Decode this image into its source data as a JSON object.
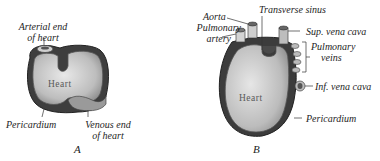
{
  "figure": {
    "panels": [
      {
        "id": "A",
        "letter": "A",
        "organ_label": "Heart",
        "labels": {
          "arterial_end_line1": "Arterial end",
          "arterial_end_line2": "of heart",
          "pericardium": "Pericardium",
          "venous_end_line1": "Venous end",
          "venous_end_line2": "of heart"
        }
      },
      {
        "id": "B",
        "letter": "B",
        "organ_label": "Heart",
        "labels": {
          "aorta": "Aorta",
          "pulmonary_artery_line1": "Pulmonary",
          "pulmonary_artery_line2": "artery",
          "transverse_sinus": "Transverse sinus",
          "sup_vena_cava": "Sup. vena cava",
          "pulmonary_veins_line1": "Pulmonary",
          "pulmonary_veins_line2": "veins",
          "inf_vena_cava": "Inf. vena cava",
          "pericardium": "Pericardium"
        }
      }
    ],
    "colors": {
      "ink": "#1e1e1e",
      "heart_light": "#d9d9d9",
      "heart_mid": "#a8a8a8",
      "pericardium_dark": "#3a3a3a"
    }
  }
}
